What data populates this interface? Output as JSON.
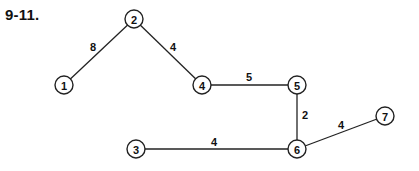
{
  "title": "9-11.",
  "nodes": [
    {
      "id": "1",
      "label": "1",
      "x": 64,
      "y": 85
    },
    {
      "id": "2",
      "label": "2",
      "x": 134,
      "y": 19
    },
    {
      "id": "3",
      "label": "3",
      "x": 136,
      "y": 149
    },
    {
      "id": "4",
      "label": "4",
      "x": 202,
      "y": 85
    },
    {
      "id": "5",
      "label": "5",
      "x": 297,
      "y": 85
    },
    {
      "id": "6",
      "label": "6",
      "x": 297,
      "y": 149
    },
    {
      "id": "7",
      "label": "7",
      "x": 385,
      "y": 116
    }
  ],
  "edges": [
    {
      "from": "1",
      "to": "2",
      "weight": "8",
      "lx": 93,
      "ly": 47
    },
    {
      "from": "2",
      "to": "4",
      "weight": "4",
      "lx": 173,
      "ly": 47
    },
    {
      "from": "4",
      "to": "5",
      "weight": "5",
      "lx": 249,
      "ly": 77
    },
    {
      "from": "5",
      "to": "6",
      "weight": "2",
      "lx": 305,
      "ly": 115
    },
    {
      "from": "3",
      "to": "6",
      "weight": "4",
      "lx": 214,
      "ly": 142
    },
    {
      "from": "6",
      "to": "7",
      "weight": "4",
      "lx": 341,
      "ly": 125
    }
  ]
}
